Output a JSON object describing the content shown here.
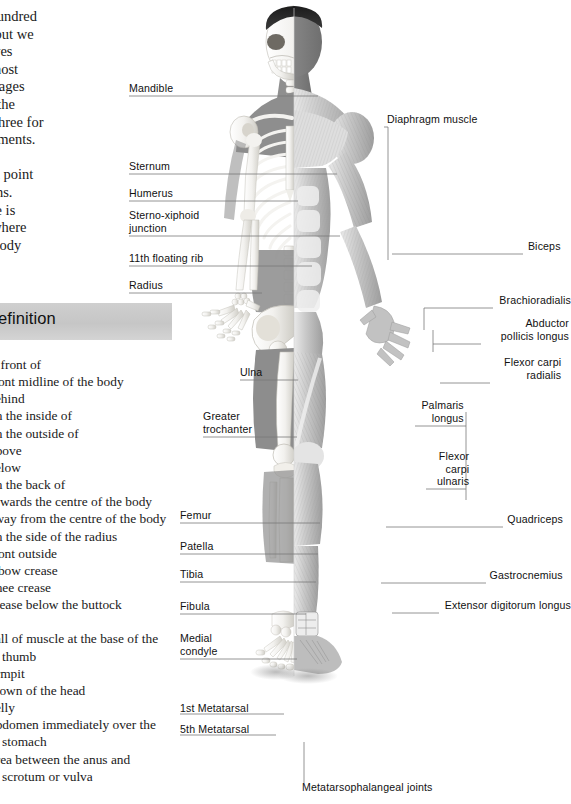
{
  "page": {
    "background": "#ffffff",
    "ink": "#111111",
    "leader_color": "#7a7a7a",
    "header_band_color": "#cbcbcb"
  },
  "intro": {
    "paragraph": "er three hundred\nne body, but we\nrn ourselves\nn of the most\nints. On pages\nble of all the\nd in part three for\nmmon ailments.\na precise\nn for each point\nf its actions.\nl language is\notion of where\nd on the body"
  },
  "definition_panel": {
    "header": "Definition",
    "items": [
      "In front of",
      "Front midline of the body",
      "Behind",
      "On the inside of",
      "On the outside of",
      "Above",
      "Below",
      "On the back of",
      "Towards the centre of the body",
      "Away from the centre of the body",
      "On the side of the radius",
      "Front outside",
      "Elbow crease",
      "Knee crease",
      "Crease below the buttock",
      "",
      "Ball of muscle at the base of the thumb",
      "Armpit",
      "Crown of the head",
      "Belly",
      "Abdomen immediately over the stomach",
      "Area between the anus and scrotum or vulva"
    ]
  },
  "figure": {
    "caption": "split anatomical figure: skeleton on left half, musculature on right half"
  },
  "labels_left": [
    {
      "text": "Mandible",
      "x": 129,
      "y": 82,
      "line_y": 96,
      "line_x2": 318
    },
    {
      "text": "Sternum",
      "x": 129,
      "y": 160,
      "line_y": 174,
      "line_x2": 337
    },
    {
      "text": "Humerus",
      "x": 129,
      "y": 187,
      "line_y": 201,
      "line_x2": 298
    },
    {
      "text": "Sterno-xiphoid\njunction",
      "x": 129,
      "y": 209,
      "line_y": 236,
      "line_x2": 340
    },
    {
      "text": "11th floating rib",
      "x": 129,
      "y": 252,
      "line_y": 266,
      "line_x2": 312
    },
    {
      "text": "Radius",
      "x": 129,
      "y": 279,
      "line_y": 293,
      "line_x2": 262
    },
    {
      "text": "Ulna",
      "x": 240,
      "y": 366,
      "line_y": 380,
      "line_x2": 298
    },
    {
      "text": "Greater\ntrochanter",
      "x": 203,
      "y": 410,
      "line_y": 437,
      "line_x2": 297
    },
    {
      "text": "Femur",
      "x": 180,
      "y": 509,
      "line_y": 523,
      "line_x2": 320
    },
    {
      "text": "Patella",
      "x": 180,
      "y": 540,
      "line_y": 554,
      "line_x2": 318
    },
    {
      "text": "Tibia",
      "x": 180,
      "y": 568,
      "line_y": 582,
      "line_x2": 316
    },
    {
      "text": "Fibula",
      "x": 180,
      "y": 600,
      "line_y": 614,
      "line_x2": 306
    },
    {
      "text": "Medial\ncondyle",
      "x": 180,
      "y": 632,
      "line_y": 659,
      "line_x2": 297
    },
    {
      "text": "1st Metatarsal",
      "x": 180,
      "y": 702,
      "line_y": 714,
      "line_x2": 284
    },
    {
      "text": "5th Metatarsal",
      "x": 180,
      "y": 723,
      "line_y": 735,
      "line_x2": 276
    },
    {
      "text": "Metatarsophalangeal joints",
      "x": 302,
      "y": 781,
      "line_y": 781,
      "line_x2": 0
    }
  ],
  "labels_right": [
    {
      "text": "Diaphragm muscle",
      "x": 388,
      "y": 113,
      "line_y": 127,
      "line_x": 388
    },
    {
      "text": "Biceps",
      "x": 527,
      "y": 240,
      "line_y": 254,
      "line_x": 392
    },
    {
      "text": "Brachioradialis",
      "x": 497,
      "y": 294,
      "line_y": 308,
      "line_x": 424
    },
    {
      "text": "Abductor\npollicis longus",
      "x": 485,
      "y": 317,
      "line_y": 344,
      "line_x": 433
    },
    {
      "text": "Flexor carpi\nradialis",
      "x": 494,
      "y": 356,
      "line_y": 383,
      "line_x": 440
    },
    {
      "text": "Palmaris\nlongus",
      "x": 419,
      "y": 399,
      "line_y": 426,
      "line_x": 466
    },
    {
      "text": "Flexor\ncarpi\nulnaris",
      "x": 430,
      "y": 450,
      "line_y": 489,
      "line_x": 466
    },
    {
      "text": "Quadriceps",
      "x": 507,
      "y": 513,
      "line_y": 527,
      "line_x": 386
    },
    {
      "text": "Gastrocnemius",
      "x": 490,
      "y": 569,
      "line_y": 583,
      "line_x": 381
    },
    {
      "text": "Extensor digitorum longus",
      "x": 443,
      "y": 599,
      "line_y": 613,
      "line_x": 392
    }
  ]
}
